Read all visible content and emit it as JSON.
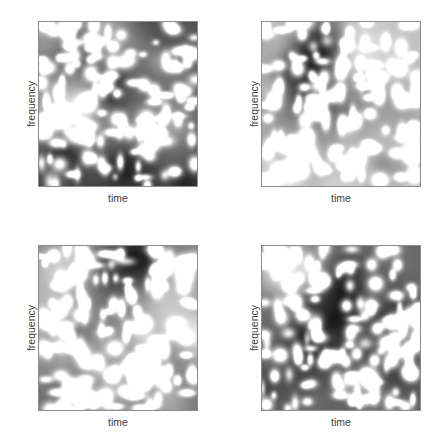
{
  "figure": {
    "background_color": "#ffffff",
    "layout": "2x2 grid of grayscale image panels",
    "border_color": "#8c8c8c",
    "label_color": "#3d3d3d"
  },
  "chart_data": [
    {
      "type": "heatmap",
      "title": "",
      "subtitle": "",
      "xlabel": "time",
      "ylabel": "frequency",
      "panel_position": "top-left",
      "panel_index": 0,
      "colormap": "gray",
      "colormap_reversed": false,
      "vmin": 0,
      "vmax": 1,
      "grid": false,
      "legend": false,
      "colorbar": false,
      "xticks": [],
      "yticks": [],
      "xticklabels": [],
      "yticklabels": [],
      "xlim": [
        0,
        1
      ],
      "ylim": [
        0,
        1
      ],
      "grid_shape": [
        64,
        64
      ],
      "description": "Smooth low-frequency gray cloud background overlaid with ~150 small bright Gaussian point blobs; dark patches concentrated upper-right and mid-left.",
      "random_seed": 11,
      "background_blob_count": 26,
      "point_blob_count": 150,
      "point_blob_sigma": 0.016,
      "background_blob_sigma": 0.12
    },
    {
      "type": "heatmap",
      "title": "",
      "subtitle": "",
      "xlabel": "time",
      "ylabel": "frequency",
      "panel_position": "top-right",
      "panel_index": 1,
      "colormap": "gray",
      "colormap_reversed": false,
      "vmin": 0,
      "vmax": 1,
      "grid": false,
      "legend": false,
      "colorbar": false,
      "xticks": [],
      "yticks": [],
      "xticklabels": [],
      "yticklabels": [],
      "xlim": [
        0,
        1
      ],
      "ylim": [
        0,
        1
      ],
      "grid_shape": [
        64,
        64
      ],
      "description": "Gray cloud texture with bright point blobs; a large bright elongated streak near the right-center and dark band across the upper-right.",
      "random_seed": 27,
      "background_blob_count": 26,
      "point_blob_count": 150,
      "point_blob_sigma": 0.016,
      "background_blob_sigma": 0.12
    },
    {
      "type": "heatmap",
      "title": "",
      "subtitle": "",
      "xlabel": "time",
      "ylabel": "frequency",
      "panel_position": "bottom-left",
      "panel_index": 2,
      "colormap": "gray",
      "colormap_reversed": false,
      "vmin": 0,
      "vmax": 1,
      "grid": false,
      "legend": false,
      "colorbar": false,
      "xticks": [],
      "yticks": [],
      "xticklabels": [],
      "yticklabels": [],
      "xlim": [
        0,
        1
      ],
      "ylim": [
        0,
        1
      ],
      "grid_shape": [
        64,
        64
      ],
      "description": "Denser bright point blobs with a bright vertical ridge through the center and dark pockets on the left and lower-right.",
      "random_seed": 43,
      "background_blob_count": 26,
      "point_blob_count": 165,
      "point_blob_sigma": 0.016,
      "background_blob_sigma": 0.12
    },
    {
      "type": "heatmap",
      "title": "",
      "subtitle": "",
      "xlabel": "time",
      "ylabel": "frequency",
      "panel_position": "bottom-right",
      "panel_index": 3,
      "colormap": "gray",
      "colormap_reversed": false,
      "vmin": 0,
      "vmax": 1,
      "grid": false,
      "legend": false,
      "colorbar": false,
      "xticks": [],
      "yticks": [],
      "xticklabels": [],
      "yticklabels": [],
      "xlim": [
        0,
        1
      ],
      "ylim": [
        0,
        1
      ],
      "grid_shape": [
        64,
        64
      ],
      "description": "Gray cloud with bright point blobs; large bright clump at lower-left-center and a dark horizontal band across the lower-middle.",
      "random_seed": 59,
      "background_blob_count": 26,
      "point_blob_count": 150,
      "point_blob_sigma": 0.016,
      "background_blob_sigma": 0.12
    }
  ],
  "panels": [
    {
      "xlabel": "time",
      "ylabel": "frequency"
    },
    {
      "xlabel": "time",
      "ylabel": "frequency"
    },
    {
      "xlabel": "time",
      "ylabel": "frequency"
    },
    {
      "xlabel": "time",
      "ylabel": "frequency"
    }
  ]
}
